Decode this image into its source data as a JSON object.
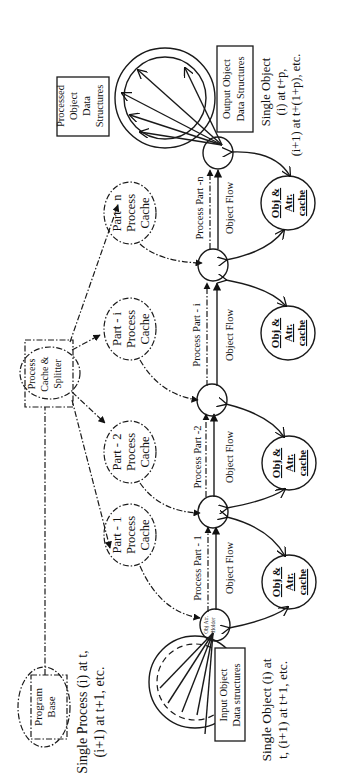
{
  "diagram": {
    "program_base": {
      "label_line1": "Program",
      "label_line2": "Base"
    },
    "single_process_note": {
      "line1": "Single Process (i) at t,",
      "line2": "(i+1) at t+1, etc."
    },
    "splitter": {
      "line1": "Process",
      "line2": "Cache &",
      "line3": "Splitter"
    },
    "part_caches": [
      {
        "line1": "Part - 1",
        "line2": "Process",
        "line3": "Cache"
      },
      {
        "line1": "Part - 2",
        "line2": "Process",
        "line3": "Cache"
      },
      {
        "line1": "Part - i",
        "line2": "Process",
        "line3": "Cache"
      },
      {
        "line1": "Part - n",
        "line2": "Process",
        "line3": "Cache"
      }
    ],
    "process_parts": [
      {
        "label": "Process Part - 1"
      },
      {
        "label": "Process Part -2"
      },
      {
        "label": "Process Part - i"
      },
      {
        "label": "Process Part -n"
      }
    ],
    "object_flow_label": "Object Flow",
    "obj_attr_caches": [
      {
        "line1": "Obj &",
        "line2": "Atr.",
        "line3": "cache"
      },
      {
        "line1": "Obj &",
        "line2": "Atr.",
        "line3": "cache"
      },
      {
        "line1": "Obj &",
        "line2": "Atr.",
        "line3": "cache"
      },
      {
        "line1": "Obj &",
        "line2": "Atr.",
        "line3": "cache"
      }
    ],
    "input_holder": {
      "line1": "Obj Atr.",
      "line2": "Holder"
    },
    "input_structures": {
      "line1": "Input Object",
      "line2": "Data structures"
    },
    "single_object_input_note": {
      "line1": "Single Object (i) at",
      "line2": "t, (i+1) at t+1, etc."
    },
    "processed_structures": {
      "line1": "Processed",
      "line2": "Object",
      "line3": "Data",
      "line4": "Structures"
    },
    "output_structures": {
      "line1": "Output Object",
      "line2": "Data Structures"
    },
    "single_object_output_note": {
      "line1": "Single Object",
      "line2": "(i) at t+p,",
      "line3": "(i+1) at t+(1+p), etc."
    }
  }
}
